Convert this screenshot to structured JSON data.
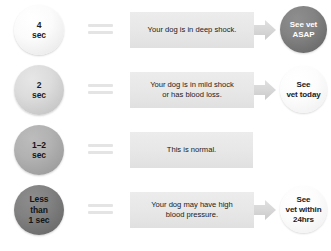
{
  "colors": {
    "background": "#ffffff",
    "message_box": "#e8e8e8",
    "equals_bar": "#e4e4e4",
    "arrow": "#d5d5d5",
    "text_dark": "#1b1b1b",
    "text_light": "#ffffff"
  },
  "chart_data": {
    "type": "table",
    "columns": [
      "Time",
      "Meaning",
      "Action"
    ],
    "rows": [
      {
        "time": "4\nsec",
        "time_value": "4",
        "time_unit": "sec",
        "meaning": "Your dog is in deep shock.",
        "action": "See vet\nASAP",
        "severity": 4
      },
      {
        "time": "2\nsec",
        "time_value": "2",
        "time_unit": "sec",
        "meaning": "Your dog is in mild shock\nor has blood loss.",
        "action": "See\nvet today",
        "severity": 3
      },
      {
        "time": "1–2\nsec",
        "time_value": "1–2",
        "time_unit": "sec",
        "meaning": "This is normal.",
        "action": "",
        "severity": 0
      },
      {
        "time": "Less\nthan\n1 sec",
        "time_value": "Less than 1",
        "time_unit": "sec",
        "meaning": "Your dog may have high\nblood pressure.",
        "action": "See\nvet within\n24hrs",
        "severity": 2
      }
    ]
  },
  "rows": [
    {
      "id": "row-4-sec",
      "time_line1": "4",
      "time_line2": "sec",
      "time_line3": "",
      "message_line1": "Your dog is in deep shock.",
      "message_line2": "",
      "has_arrow": true,
      "has_action": true,
      "action_line1": "See vet",
      "action_line2": "ASAP",
      "action_line3": "",
      "action_style": "dark",
      "circle_style": "tc-1"
    },
    {
      "id": "row-2-sec",
      "time_line1": "2",
      "time_line2": "sec",
      "time_line3": "",
      "message_line1": "Your dog is in mild shock",
      "message_line2": "or has blood loss.",
      "has_arrow": true,
      "has_action": true,
      "action_line1": "See",
      "action_line2": "vet today",
      "action_line3": "",
      "action_style": "light",
      "circle_style": "tc-2"
    },
    {
      "id": "row-1-2-sec",
      "time_line1": "1–2",
      "time_line2": "sec",
      "time_line3": "",
      "message_line1": "This is normal.",
      "message_line2": "",
      "has_arrow": false,
      "has_action": false,
      "action_line1": "",
      "action_line2": "",
      "action_line3": "",
      "action_style": "light",
      "circle_style": "tc-3"
    },
    {
      "id": "row-less-than-1-sec",
      "time_line1": "Less",
      "time_line2": "than",
      "time_line3": "1 sec",
      "message_line1": "Your dog may have high",
      "message_line2": "blood pressure.",
      "has_arrow": true,
      "has_action": true,
      "action_line1": "See",
      "action_line2": "vet within",
      "action_line3": "24hrs",
      "action_style": "light",
      "circle_style": "tc-4"
    }
  ]
}
